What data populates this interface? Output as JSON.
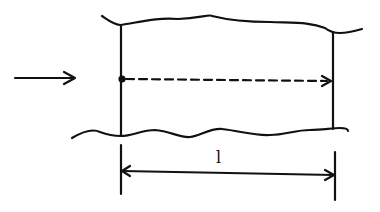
{
  "diagram": {
    "type": "channel-segment",
    "stroke_color": "#111111",
    "background": "#ffffff",
    "incoming_arrow": {
      "label": "",
      "direction": "right"
    },
    "path": {
      "style": "dashed",
      "start_marker": "dot",
      "end_marker": "arrow",
      "direction": "right"
    },
    "dimension": {
      "label": "l",
      "style": "double-arrow"
    }
  }
}
